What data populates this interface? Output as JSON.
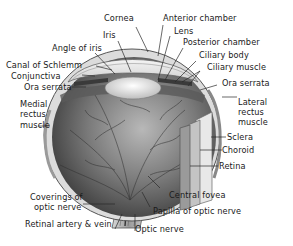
{
  "diagram": {
    "labels": {
      "cornea": "Cornea",
      "anterior_chamber": "Anterior chamber",
      "iris": "Iris",
      "lens": "Lens",
      "angle_of_iris": "Angle of iris",
      "posterior_chamber": "Posterior chamber",
      "ciliary_body": "Ciliary body",
      "canal_of_schlemm": "Canal of Schlemm",
      "ciliary_muscle": "Ciliary muscle",
      "conjunctiva": "Conjunctiva",
      "ora_serrata_left": "Ora serrata",
      "ora_serrata_right": "Ora serrata",
      "medial_rectus_1": "Medial",
      "medial_rectus_2": "rectus",
      "medial_rectus_3": "muscle",
      "lateral_rectus_1": "Lateral",
      "lateral_rectus_2": "rectus",
      "lateral_rectus_3": "muscle",
      "sclera": "Sclera",
      "choroid": "Choroid",
      "retina": "Retina",
      "coverings_1": "Coverings of",
      "coverings_2": "optic nerve",
      "central_fovea": "Central fovea",
      "papilla": "Papilla of optic nerve",
      "retinal_artery": "Retinal artery & vein",
      "optic_nerve": "Optic nerve"
    },
    "colors": {
      "background": "#ffffff",
      "text": "#1a1a1a",
      "leader_line": "#2a2a2a",
      "eyeball_dark": "#4a4a4a",
      "eyeball_mid": "#8a8a8a",
      "eyeball_light": "#c8c8c8",
      "cornea": "#e6e6e6",
      "lens": "#f0f0f0"
    }
  }
}
